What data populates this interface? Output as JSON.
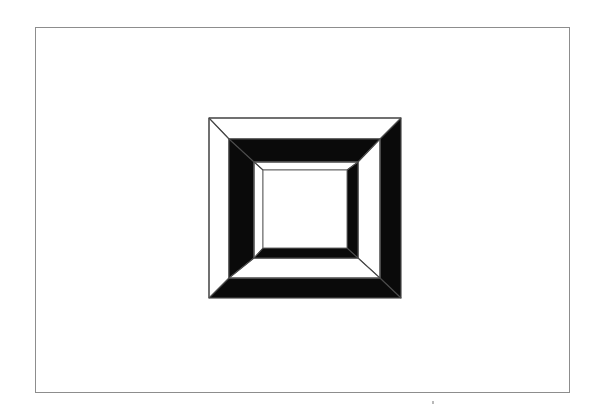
{
  "page": {
    "width": 602,
    "height": 414,
    "background_color": "#ffffff"
  },
  "plate": {
    "border_color": "#8d8d8d",
    "border_width": 1,
    "x": 35,
    "y": 27,
    "width": 535,
    "height": 366,
    "fill_color": "#ffffff",
    "label": "plate-border"
  },
  "figure": {
    "name": "nested-square-frames",
    "description": "Three concentric beveled square frames drawn in line art; black shading alternates between opposite pairs of sides so the depth ordering is ambiguous.",
    "x": 206,
    "y": 113,
    "width": 198,
    "height": 186,
    "ink_color": "#0a0a0a",
    "line_color": "#5a5a5a",
    "fill_color": "#ffffff",
    "frames": [
      {
        "name": "outer-frame",
        "order": 1,
        "black_sides": [
          "right",
          "bottom"
        ],
        "outline_sides": [
          "top",
          "left"
        ],
        "outer_box": {
          "x": 3,
          "y": 5,
          "width": 192,
          "height": 180
        },
        "inner_box": {
          "x": 23,
          "y": 26,
          "width": 151,
          "height": 139
        }
      },
      {
        "name": "middle-frame",
        "order": 2,
        "black_sides": [
          "top",
          "left"
        ],
        "outline_sides": [
          "right",
          "bottom"
        ],
        "outer_box": {
          "x": 23,
          "y": 26,
          "width": 151,
          "height": 139
        },
        "inner_box": {
          "x": 48,
          "y": 49,
          "width": 104,
          "height": 96
        }
      },
      {
        "name": "inner-frame",
        "order": 3,
        "black_sides": [
          "right",
          "bottom"
        ],
        "outline_sides": [
          "top",
          "left"
        ],
        "outer_box": {
          "x": 48,
          "y": 49,
          "width": 104,
          "height": 96
        },
        "inner_box": {
          "x": 57,
          "y": 57,
          "width": 84,
          "height": 78
        }
      }
    ],
    "center_panel": {
      "name": "center-panel",
      "x": 57,
      "y": 57,
      "width": 84,
      "height": 78,
      "fill_color": "#ffffff"
    }
  },
  "artifacts": {
    "scan_speck": {
      "x": 432,
      "y": 401,
      "width": 2,
      "height": 3,
      "color": "#b9b9b9"
    }
  }
}
